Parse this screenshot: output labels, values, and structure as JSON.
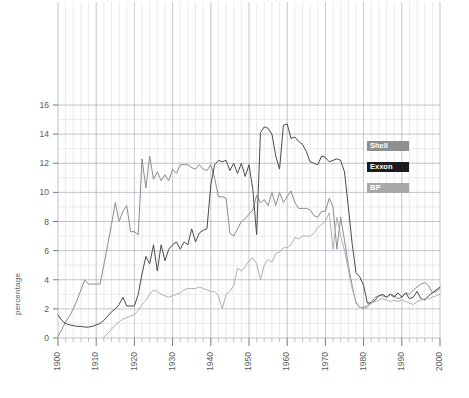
{
  "chart_data": {
    "type": "line",
    "title": "",
    "subtitle": "",
    "xlabel": "",
    "ylabel": "percentage",
    "xlim": [
      1900,
      2000
    ],
    "ylim": [
      0,
      16
    ],
    "x_ticks": [
      1900,
      1910,
      1920,
      1930,
      1940,
      1950,
      1960,
      1970,
      1980,
      1990,
      2000
    ],
    "y_ticks": [
      0,
      2,
      4,
      6,
      8,
      10,
      12,
      14,
      16
    ],
    "x_tick_labels": [
      "1900",
      "1910",
      "1920",
      "1930",
      "1940",
      "1950",
      "1960",
      "1970",
      "1980",
      "1990",
      "2000"
    ],
    "y_tick_labels": [
      "0",
      "2",
      "4",
      "6",
      "8",
      "10",
      "12",
      "14",
      "16"
    ],
    "grid": true,
    "grid_minor": true,
    "legend_position": "right",
    "series": [
      {
        "name": "Shell",
        "color": "#8c8c8c",
        "label_bg": "#8f8f8f",
        "points": [
          [
            1900,
            0.1
          ],
          [
            1901,
            0.6
          ],
          [
            1902,
            1.1
          ],
          [
            1903,
            1.5
          ],
          [
            1904,
            2.0
          ],
          [
            1905,
            2.6
          ],
          [
            1906,
            3.3
          ],
          [
            1907,
            4.0
          ],
          [
            1908,
            3.7
          ],
          [
            1909,
            3.7
          ],
          [
            1910,
            3.7
          ],
          [
            1911,
            3.7
          ],
          [
            1912,
            5.0
          ],
          [
            1913,
            6.4
          ],
          [
            1914,
            7.8
          ],
          [
            1915,
            9.3
          ],
          [
            1916,
            8.0
          ],
          [
            1917,
            8.7
          ],
          [
            1918,
            9.1
          ],
          [
            1919,
            7.3
          ],
          [
            1920,
            7.3
          ],
          [
            1921,
            7.1
          ],
          [
            1922,
            12.3
          ],
          [
            1923,
            10.3
          ],
          [
            1924,
            12.5
          ],
          [
            1925,
            10.9
          ],
          [
            1926,
            11.4
          ],
          [
            1927,
            10.8
          ],
          [
            1928,
            11.2
          ],
          [
            1929,
            10.8
          ],
          [
            1930,
            11.6
          ],
          [
            1931,
            11.3
          ],
          [
            1932,
            11.9
          ],
          [
            1933,
            11.9
          ],
          [
            1934,
            11.9
          ],
          [
            1935,
            11.7
          ],
          [
            1936,
            11.6
          ],
          [
            1937,
            11.9
          ],
          [
            1938,
            11.6
          ],
          [
            1939,
            11.5
          ],
          [
            1940,
            11.9
          ],
          [
            1941,
            11.0
          ],
          [
            1942,
            9.7
          ],
          [
            1943,
            9.7
          ],
          [
            1944,
            9.6
          ],
          [
            1945,
            7.2
          ],
          [
            1946,
            7.0
          ],
          [
            1947,
            7.5
          ],
          [
            1948,
            8.0
          ],
          [
            1949,
            8.2
          ],
          [
            1950,
            8.5
          ],
          [
            1951,
            8.8
          ],
          [
            1952,
            9.8
          ],
          [
            1953,
            9.3
          ],
          [
            1954,
            9.5
          ],
          [
            1955,
            9.1
          ],
          [
            1956,
            10.0
          ],
          [
            1957,
            9.1
          ],
          [
            1958,
            10.0
          ],
          [
            1959,
            9.3
          ],
          [
            1960,
            9.7
          ],
          [
            1961,
            10.1
          ],
          [
            1962,
            9.3
          ],
          [
            1963,
            8.9
          ],
          [
            1964,
            8.9
          ],
          [
            1965,
            8.9
          ],
          [
            1966,
            8.8
          ],
          [
            1967,
            8.4
          ],
          [
            1968,
            8.3
          ],
          [
            1969,
            8.7
          ],
          [
            1970,
            8.7
          ],
          [
            1971,
            9.6
          ],
          [
            1972,
            9.0
          ],
          [
            1973,
            6.1
          ],
          [
            1974,
            8.3
          ],
          [
            1975,
            6.7
          ],
          [
            1976,
            5.0
          ],
          [
            1977,
            3.6
          ],
          [
            1978,
            2.4
          ],
          [
            1979,
            2.1
          ],
          [
            1980,
            2.1
          ],
          [
            1981,
            2.2
          ],
          [
            1982,
            2.5
          ],
          [
            1983,
            2.8
          ],
          [
            1984,
            2.9
          ],
          [
            1985,
            2.9
          ],
          [
            1986,
            2.8
          ],
          [
            1987,
            3.0
          ],
          [
            1988,
            2.9
          ],
          [
            1989,
            2.7
          ],
          [
            1990,
            2.8
          ],
          [
            1991,
            3.1
          ],
          [
            1992,
            3.0
          ],
          [
            1993,
            3.3
          ],
          [
            1994,
            3.5
          ],
          [
            1995,
            3.7
          ],
          [
            1996,
            3.8
          ],
          [
            1997,
            3.6
          ],
          [
            1998,
            3.1
          ],
          [
            1999,
            3.2
          ],
          [
            2000,
            3.4
          ]
        ]
      },
      {
        "name": "Exxon",
        "color": "#4a4a4a",
        "label_bg": "#1c1c1c",
        "points": [
          [
            1900,
            1.6
          ],
          [
            1901,
            1.2
          ],
          [
            1902,
            1.0
          ],
          [
            1903,
            0.9
          ],
          [
            1904,
            0.85
          ],
          [
            1905,
            0.8
          ],
          [
            1906,
            0.8
          ],
          [
            1907,
            0.75
          ],
          [
            1908,
            0.75
          ],
          [
            1909,
            0.8
          ],
          [
            1910,
            0.9
          ],
          [
            1911,
            1.0
          ],
          [
            1912,
            1.2
          ],
          [
            1913,
            1.5
          ],
          [
            1914,
            1.8
          ],
          [
            1915,
            2.0
          ],
          [
            1916,
            2.3
          ],
          [
            1917,
            2.8
          ],
          [
            1918,
            2.2
          ],
          [
            1919,
            2.2
          ],
          [
            1920,
            2.2
          ],
          [
            1921,
            3.0
          ],
          [
            1922,
            4.4
          ],
          [
            1923,
            5.6
          ],
          [
            1924,
            5.1
          ],
          [
            1925,
            6.4
          ],
          [
            1926,
            4.6
          ],
          [
            1927,
            6.4
          ],
          [
            1928,
            5.3
          ],
          [
            1929,
            6.1
          ],
          [
            1930,
            6.4
          ],
          [
            1931,
            6.6
          ],
          [
            1932,
            6.1
          ],
          [
            1933,
            6.6
          ],
          [
            1934,
            6.4
          ],
          [
            1935,
            7.5
          ],
          [
            1936,
            6.6
          ],
          [
            1937,
            7.2
          ],
          [
            1938,
            7.4
          ],
          [
            1939,
            7.5
          ],
          [
            1940,
            10.5
          ],
          [
            1941,
            11.9
          ],
          [
            1942,
            12.2
          ],
          [
            1943,
            12.1
          ],
          [
            1944,
            12.2
          ],
          [
            1945,
            11.5
          ],
          [
            1946,
            12.0
          ],
          [
            1947,
            11.3
          ],
          [
            1948,
            12.0
          ],
          [
            1949,
            11.1
          ],
          [
            1950,
            11.9
          ],
          [
            1951,
            10.2
          ],
          [
            1952,
            7.1
          ],
          [
            1953,
            14.1
          ],
          [
            1954,
            14.5
          ],
          [
            1955,
            14.4
          ],
          [
            1956,
            14.0
          ],
          [
            1957,
            12.5
          ],
          [
            1958,
            11.6
          ],
          [
            1959,
            14.6
          ],
          [
            1960,
            14.7
          ],
          [
            1961,
            13.7
          ],
          [
            1962,
            13.8
          ],
          [
            1963,
            13.5
          ],
          [
            1964,
            13.3
          ],
          [
            1965,
            12.8
          ],
          [
            1966,
            12.1
          ],
          [
            1967,
            12.0
          ],
          [
            1968,
            11.9
          ],
          [
            1969,
            12.5
          ],
          [
            1970,
            12.4
          ],
          [
            1971,
            12.1
          ],
          [
            1972,
            12.2
          ],
          [
            1973,
            12.3
          ],
          [
            1974,
            12.2
          ],
          [
            1975,
            11.4
          ],
          [
            1976,
            9.0
          ],
          [
            1977,
            6.5
          ],
          [
            1978,
            4.5
          ],
          [
            1979,
            4.2
          ],
          [
            1980,
            3.6
          ],
          [
            1981,
            2.4
          ],
          [
            1982,
            2.4
          ],
          [
            1983,
            2.6
          ],
          [
            1984,
            2.9
          ],
          [
            1985,
            3.0
          ],
          [
            1986,
            2.8
          ],
          [
            1987,
            3.0
          ],
          [
            1988,
            2.8
          ],
          [
            1989,
            3.1
          ],
          [
            1990,
            2.8
          ],
          [
            1991,
            3.1
          ],
          [
            1992,
            2.7
          ],
          [
            1993,
            2.8
          ],
          [
            1994,
            3.2
          ],
          [
            1995,
            2.7
          ],
          [
            1996,
            2.6
          ],
          [
            1997,
            2.9
          ],
          [
            1998,
            3.1
          ],
          [
            1999,
            3.3
          ],
          [
            2000,
            3.5
          ]
        ]
      },
      {
        "name": "BP",
        "color": "#b0b0b0",
        "label_bg": "#a8a8a8",
        "points": [
          [
            1912,
            0.05
          ],
          [
            1913,
            0.3
          ],
          [
            1914,
            0.6
          ],
          [
            1915,
            0.9
          ],
          [
            1916,
            1.1
          ],
          [
            1917,
            1.3
          ],
          [
            1918,
            1.4
          ],
          [
            1919,
            1.5
          ],
          [
            1920,
            1.6
          ],
          [
            1921,
            1.9
          ],
          [
            1922,
            2.3
          ],
          [
            1923,
            2.6
          ],
          [
            1924,
            3.0
          ],
          [
            1925,
            3.3
          ],
          [
            1926,
            3.2
          ],
          [
            1927,
            3.0
          ],
          [
            1928,
            2.9
          ],
          [
            1929,
            2.8
          ],
          [
            1930,
            2.9
          ],
          [
            1931,
            3.0
          ],
          [
            1932,
            3.1
          ],
          [
            1933,
            3.3
          ],
          [
            1934,
            3.4
          ],
          [
            1935,
            3.4
          ],
          [
            1936,
            3.4
          ],
          [
            1937,
            3.5
          ],
          [
            1938,
            3.4
          ],
          [
            1939,
            3.3
          ],
          [
            1940,
            3.2
          ],
          [
            1941,
            3.2
          ],
          [
            1942,
            2.9
          ],
          [
            1943,
            2.0
          ],
          [
            1944,
            3.0
          ],
          [
            1945,
            3.2
          ],
          [
            1946,
            3.6
          ],
          [
            1947,
            4.8
          ],
          [
            1948,
            4.6
          ],
          [
            1949,
            4.9
          ],
          [
            1950,
            5.3
          ],
          [
            1951,
            5.5
          ],
          [
            1952,
            5.1
          ],
          [
            1953,
            4.0
          ],
          [
            1954,
            5.0
          ],
          [
            1955,
            5.4
          ],
          [
            1956,
            5.2
          ],
          [
            1957,
            5.8
          ],
          [
            1958,
            5.9
          ],
          [
            1959,
            6.2
          ],
          [
            1960,
            6.2
          ],
          [
            1961,
            6.4
          ],
          [
            1962,
            6.9
          ],
          [
            1963,
            6.8
          ],
          [
            1964,
            7.0
          ],
          [
            1965,
            7.0
          ],
          [
            1966,
            7.0
          ],
          [
            1967,
            7.2
          ],
          [
            1968,
            7.6
          ],
          [
            1969,
            7.8
          ],
          [
            1970,
            8.0
          ],
          [
            1971,
            8.6
          ],
          [
            1972,
            6.1
          ],
          [
            1973,
            8.3
          ],
          [
            1974,
            7.0
          ],
          [
            1975,
            6.0
          ],
          [
            1976,
            4.7
          ],
          [
            1977,
            3.4
          ],
          [
            1978,
            2.5
          ],
          [
            1979,
            2.1
          ],
          [
            1980,
            2.0
          ],
          [
            1981,
            2.1
          ],
          [
            1982,
            2.4
          ],
          [
            1983,
            2.5
          ],
          [
            1984,
            2.6
          ],
          [
            1985,
            2.7
          ],
          [
            1986,
            2.6
          ],
          [
            1987,
            2.5
          ],
          [
            1988,
            2.6
          ],
          [
            1989,
            2.5
          ],
          [
            1990,
            2.6
          ],
          [
            1991,
            2.5
          ],
          [
            1992,
            2.4
          ],
          [
            1993,
            2.3
          ],
          [
            1994,
            2.5
          ],
          [
            1995,
            2.6
          ],
          [
            1996,
            2.7
          ],
          [
            1997,
            2.7
          ],
          [
            1998,
            2.8
          ],
          [
            1999,
            2.9
          ],
          [
            2000,
            3.0
          ]
        ]
      }
    ]
  },
  "legend": {
    "items": [
      {
        "label": "Shell",
        "bg": "#8f8f8f"
      },
      {
        "label": "Exxon",
        "bg": "#1c1c1c"
      },
      {
        "label": "BP",
        "bg": "#a8a8a8"
      }
    ]
  },
  "axis": {
    "y_title": "percentage"
  },
  "colors": {
    "grid_major": "#9aa0b0",
    "grid_minor": "#dfe3ea",
    "background": "#ffffff"
  }
}
